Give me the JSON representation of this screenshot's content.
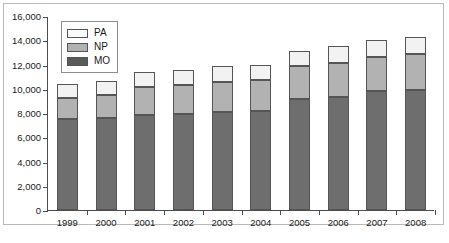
{
  "chart_data": {
    "type": "bar",
    "subtype": "stacked-bar",
    "title": "",
    "subtitle": "",
    "xlabel": "",
    "ylabel": "",
    "categories": [
      "1999",
      "2000",
      "2001",
      "2002",
      "2003",
      "2004",
      "2005",
      "2006",
      "2007",
      "2008"
    ],
    "series": [
      {
        "name": "MO",
        "color": "#6e6e6e",
        "values": [
          7500,
          7550,
          7850,
          7950,
          8100,
          8150,
          9150,
          9300,
          9800,
          9900
        ]
      },
      {
        "name": "NP",
        "color": "#b2b2b2",
        "values": [
          1750,
          1900,
          2300,
          2350,
          2450,
          2550,
          2700,
          2800,
          2800,
          2950
        ]
      },
      {
        "name": "PA",
        "color": "#f2f2f2",
        "values": [
          1150,
          1150,
          1250,
          1250,
          1300,
          1300,
          1250,
          1400,
          1450,
          1450
        ]
      }
    ],
    "totals": [
      10400,
      10600,
      11400,
      11550,
      11850,
      12000,
      13100,
      13500,
      14050,
      14300
    ],
    "cumulative": {
      "mo_top": [
        7500,
        7550,
        7850,
        7950,
        8100,
        8150,
        9150,
        9300,
        9800,
        9900
      ],
      "np_top": [
        9250,
        9450,
        10150,
        10300,
        10550,
        10700,
        11850,
        12100,
        12600,
        12850
      ],
      "pa_top": [
        10400,
        10600,
        11400,
        11550,
        11850,
        12000,
        13100,
        13500,
        14050,
        14300
      ]
    },
    "ylim": [
      0,
      16000
    ],
    "ytick_step": 2000,
    "ytick_labels": [
      "0",
      "2,000",
      "4,000",
      "6,000",
      "8,000",
      "10,000",
      "12,000",
      "14,000",
      "16,000"
    ],
    "ytick_values": [
      0,
      2000,
      4000,
      6000,
      8000,
      10000,
      12000,
      14000,
      16000
    ],
    "grid": false,
    "legend_position": "top-left",
    "legend_entries": [
      {
        "label": "PA",
        "color": "#f2f2f2"
      },
      {
        "label": "NP",
        "color": "#b2b2b2"
      },
      {
        "label": "MO",
        "color": "#5a5a5a"
      }
    ]
  },
  "footnote": ""
}
